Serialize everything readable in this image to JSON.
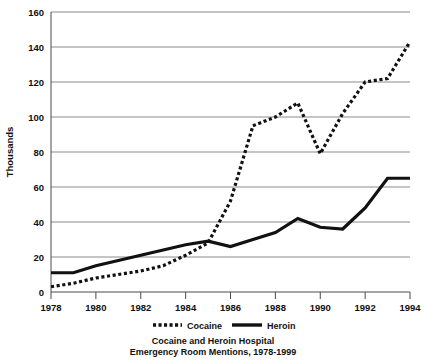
{
  "chart_data": {
    "type": "line",
    "title_line1": "Cocaine and Heroin Hospital",
    "title_line2": "Emergency Room Mentions, 1978-1999",
    "xlabel": "",
    "ylabel": "Thousands",
    "xlim": [
      1978,
      1994
    ],
    "ylim": [
      0,
      160
    ],
    "grid": true,
    "legend_position": "bottom",
    "x": [
      1978,
      1979,
      1980,
      1981,
      1982,
      1983,
      1984,
      1985,
      1986,
      1987,
      1988,
      1989,
      1990,
      1991,
      1992,
      1993,
      1994
    ],
    "xticks": [
      "1978",
      "1980",
      "1982",
      "1984",
      "1986",
      "1988",
      "1990",
      "1992",
      "1994"
    ],
    "xtick_values": [
      1978,
      1980,
      1982,
      1984,
      1986,
      1988,
      1990,
      1992,
      1994
    ],
    "yticks": [
      "0",
      "20",
      "40",
      "60",
      "80",
      "100",
      "120",
      "140",
      "160"
    ],
    "ytick_values": [
      0,
      20,
      40,
      60,
      80,
      100,
      120,
      140,
      160
    ],
    "series": [
      {
        "name": "Cocaine",
        "style": "dotted",
        "color": "#111111",
        "values": [
          3,
          5,
          8,
          10,
          12,
          15,
          21,
          28,
          52,
          95,
          100,
          108,
          79,
          102,
          120,
          122,
          143
        ]
      },
      {
        "name": "Heroin",
        "style": "solid",
        "color": "#111111",
        "values": [
          11,
          11,
          15,
          18,
          21,
          24,
          27,
          29,
          26,
          30,
          34,
          42,
          37,
          36,
          48,
          65,
          65
        ]
      }
    ],
    "legend": [
      {
        "label": "Cocaine",
        "style": "dotted"
      },
      {
        "label": "Heroin",
        "style": "solid"
      }
    ]
  }
}
